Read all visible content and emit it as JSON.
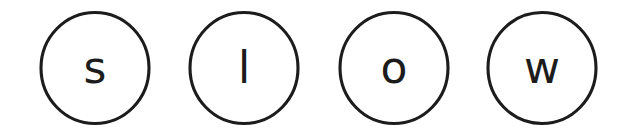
{
  "scene": {
    "title": "slow",
    "word": "slow",
    "background_color": "#ffffff",
    "ink_color": "#1c1c1c",
    "stroke_width_px": 3,
    "shape": "circle",
    "item_count": 4,
    "description": "Four hand-drawn outlined circles in a row, each containing one lowercase letter, spelling the word slow"
  },
  "tokens": [
    {
      "index": 1,
      "letter": "s",
      "icon_name": "circle-outline",
      "center_x": 95,
      "center_y": 68,
      "diameter": 112,
      "letter_case": "lowercase"
    },
    {
      "index": 2,
      "letter": "l",
      "icon_name": "circle-outline",
      "center_x": 244,
      "center_y": 68,
      "diameter": 112,
      "letter_case": "lowercase"
    },
    {
      "index": 3,
      "letter": "o",
      "icon_name": "circle-outline",
      "center_x": 394,
      "center_y": 68,
      "diameter": 112,
      "letter_case": "lowercase"
    },
    {
      "index": 4,
      "letter": "w",
      "icon_name": "circle-outline",
      "center_x": 542,
      "center_y": 68,
      "diameter": 112,
      "letter_case": "lowercase"
    }
  ]
}
